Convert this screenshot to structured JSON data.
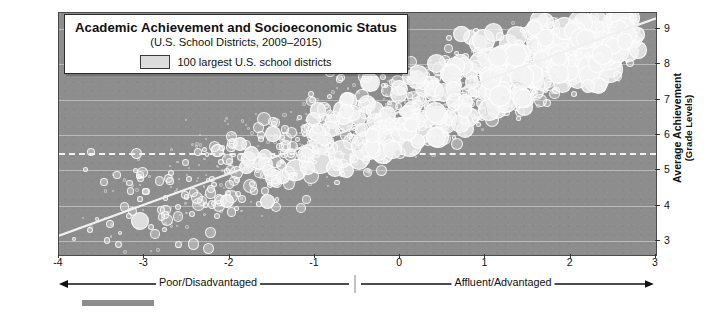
{
  "source_credit": "Source: Data from the Educational Opportunity Project at Stanford University and Money, Race and Success: How Your School District Compares, New York Times. Visualization by E.H. Fouberg and A.B. Murphy. © 2020 John Wiley & Sons, Inc.",
  "legend": {
    "label": "100 largest U.S. school districts",
    "swatch_name": "bubble-size-swatch"
  },
  "axis_annotations": {
    "left_label": "Poor/Disadvantaged",
    "right_label": "Affluent/Advantaged"
  },
  "colors": {
    "plot_background": "#8d8d8d",
    "bubble_fill": "#f4f4f4",
    "gridline": "#c9c9c9",
    "dashed_reference": "#f2f2f2",
    "frame_border": "#4b4b4b",
    "text": "#111111"
  },
  "chart_data": {
    "type": "scatter",
    "title": "Academic Achievement and Socioeconomic Status",
    "subtitle": "(U.S. School Districts, 2009–2015)",
    "xlabel": "",
    "ylabel": "Average Achievement",
    "ylabel_sub": "(Grade Levels)",
    "xlim": [
      -4,
      3
    ],
    "ylim": [
      2.6,
      9.45
    ],
    "xticks": [
      -4,
      -3,
      -2,
      -1,
      0,
      1,
      2,
      3
    ],
    "xticklabels": [
      "-4",
      "-3",
      "-2",
      "-1",
      "0",
      "1",
      "2",
      "3"
    ],
    "yticks": [
      3,
      4,
      5,
      6,
      7,
      8,
      9
    ],
    "yticklabels": [
      "3",
      "4",
      "5",
      "6",
      "7",
      "8",
      "9"
    ],
    "grid": true,
    "legend_position": "top-left-inset",
    "reference_line": {
      "orientation": "horizontal",
      "y": 5.5,
      "style": "dashed"
    },
    "trend_line": {
      "x": [
        -4,
        3
      ],
      "y": [
        3.15,
        9.3
      ],
      "style": "solid"
    },
    "bubble_encoding": "marker area ≈ school district enrollment",
    "series": [
      {
        "name": "U.S. school districts",
        "points": [
          {
            "x": -3.82,
            "y": 3.05,
            "r": 2
          },
          {
            "x": -3.64,
            "y": 3.3,
            "r": 3
          },
          {
            "x": -3.55,
            "y": 3.62,
            "r": 2
          },
          {
            "x": -3.4,
            "y": 3.48,
            "r": 4
          },
          {
            "x": -3.28,
            "y": 3.22,
            "r": 2
          },
          {
            "x": -3.18,
            "y": 3.7,
            "r": 3
          },
          {
            "x": -3.05,
            "y": 3.55,
            "r": 9
          },
          {
            "x": -2.92,
            "y": 3.4,
            "r": 3
          },
          {
            "x": -2.8,
            "y": 3.88,
            "r": 4
          },
          {
            "x": -2.74,
            "y": 3.6,
            "r": 6
          },
          {
            "x": -2.6,
            "y": 3.95,
            "r": 3
          },
          {
            "x": -2.52,
            "y": 4.3,
            "r": 4
          },
          {
            "x": -2.44,
            "y": 3.75,
            "r": 3
          },
          {
            "x": -2.32,
            "y": 4.12,
            "r": 5
          },
          {
            "x": -2.22,
            "y": 4.48,
            "r": 4
          },
          {
            "x": -2.12,
            "y": 3.98,
            "r": 6
          },
          {
            "x": -2.02,
            "y": 4.35,
            "r": 3
          },
          {
            "x": -1.95,
            "y": 4.7,
            "r": 5
          },
          {
            "x": -1.86,
            "y": 4.2,
            "r": 4
          },
          {
            "x": -1.76,
            "y": 4.55,
            "r": 7
          },
          {
            "x": -1.66,
            "y": 4.92,
            "r": 5
          },
          {
            "x": -1.58,
            "y": 4.42,
            "r": 4
          },
          {
            "x": -1.48,
            "y": 4.78,
            "r": 9
          },
          {
            "x": -1.4,
            "y": 5.15,
            "r": 5
          },
          {
            "x": -1.3,
            "y": 4.62,
            "r": 6
          },
          {
            "x": -1.22,
            "y": 5.02,
            "r": 11
          },
          {
            "x": -1.12,
            "y": 5.38,
            "r": 6
          },
          {
            "x": -1.04,
            "y": 4.85,
            "r": 8
          },
          {
            "x": -0.94,
            "y": 5.25,
            "r": 13
          },
          {
            "x": -0.86,
            "y": 5.6,
            "r": 7
          },
          {
            "x": -0.76,
            "y": 5.05,
            "r": 9
          },
          {
            "x": -0.68,
            "y": 5.45,
            "r": 14
          },
          {
            "x": -0.58,
            "y": 5.8,
            "r": 8
          },
          {
            "x": -0.48,
            "y": 5.28,
            "r": 10
          },
          {
            "x": -0.4,
            "y": 5.68,
            "r": 15
          },
          {
            "x": -0.3,
            "y": 6.02,
            "r": 9
          },
          {
            "x": -0.2,
            "y": 5.5,
            "r": 11
          },
          {
            "x": -0.1,
            "y": 5.9,
            "r": 13
          },
          {
            "x": 0.0,
            "y": 6.22,
            "r": 10
          },
          {
            "x": 0.12,
            "y": 5.72,
            "r": 12
          },
          {
            "x": 0.22,
            "y": 6.1,
            "r": 14
          },
          {
            "x": 0.32,
            "y": 6.45,
            "r": 9
          },
          {
            "x": 0.44,
            "y": 5.95,
            "r": 11
          },
          {
            "x": 0.54,
            "y": 6.32,
            "r": 10
          },
          {
            "x": 0.64,
            "y": 6.68,
            "r": 8
          },
          {
            "x": 0.76,
            "y": 6.18,
            "r": 9
          },
          {
            "x": 0.86,
            "y": 6.55,
            "r": 7
          },
          {
            "x": 0.96,
            "y": 6.9,
            "r": 6
          },
          {
            "x": 1.08,
            "y": 6.42,
            "r": 7
          },
          {
            "x": 1.18,
            "y": 6.78,
            "r": 6
          },
          {
            "x": 1.28,
            "y": 7.12,
            "r": 5
          },
          {
            "x": 1.4,
            "y": 6.65,
            "r": 5
          },
          {
            "x": 1.5,
            "y": 7.02,
            "r": 4
          },
          {
            "x": 1.6,
            "y": 7.38,
            "r": 4
          },
          {
            "x": 1.72,
            "y": 6.9,
            "r": 4
          },
          {
            "x": 1.82,
            "y": 7.28,
            "r": 3
          },
          {
            "x": 1.92,
            "y": 7.62,
            "r": 3
          },
          {
            "x": 2.04,
            "y": 7.15,
            "r": 3
          },
          {
            "x": 2.14,
            "y": 7.52,
            "r": 3
          },
          {
            "x": 2.24,
            "y": 7.88,
            "r": 2
          },
          {
            "x": 2.36,
            "y": 7.4,
            "r": 2
          },
          {
            "x": 2.46,
            "y": 8.18,
            "r": 2
          },
          {
            "x": 2.56,
            "y": 8.55,
            "r": 2
          },
          {
            "x": 2.66,
            "y": 8.1,
            "r": 2
          },
          {
            "x": 2.76,
            "y": 8.8,
            "r": 2
          }
        ]
      }
    ]
  }
}
